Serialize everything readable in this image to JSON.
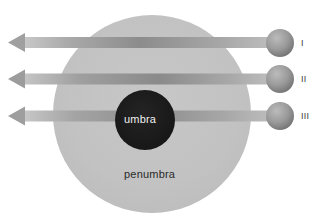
{
  "figure": {
    "type": "eclipse-shadow-diagram",
    "background_color": "#ffffff",
    "width": 322,
    "height": 223
  },
  "shadow_regions": [
    {
      "id": "penumbra",
      "label": "penumbra",
      "color": "#c3c3c3",
      "label_color": "#2a2a2a",
      "center_x": 152,
      "center_y": 114,
      "radius": 99
    },
    {
      "id": "umbra",
      "label": "umbra",
      "color": "#1c1c1c",
      "label_color": "#f0f0f0",
      "center_x": 145,
      "center_y": 120,
      "radius": 30
    }
  ],
  "rays": [
    {
      "id": "ray-1",
      "label": "I",
      "y": 43,
      "arrow_tip_x": 8,
      "tail_x": 282,
      "band_color_light": "#cfcfcf",
      "band_color_dark": "#8e8e8e"
    },
    {
      "id": "ray-2",
      "label": "II",
      "y": 79,
      "arrow_tip_x": 8,
      "tail_x": 282,
      "band_color_light": "#cfcfcf",
      "band_color_dark": "#8e8e8e"
    },
    {
      "id": "ray-3",
      "label": "III",
      "y": 116,
      "arrow_tip_x": 8,
      "tail_x": 282,
      "band_color_light": "#cfcfcf",
      "band_color_dark": "#8e8e8e"
    }
  ],
  "spheres": [
    {
      "id": "sphere-1",
      "label": "I",
      "cx": 280,
      "cy": 43,
      "r": 14,
      "color_light": "#b9b9b9",
      "color_dark": "#747474"
    },
    {
      "id": "sphere-2",
      "label": "II",
      "cx": 280,
      "cy": 79,
      "r": 14,
      "color_light": "#b9b9b9",
      "color_dark": "#747474"
    },
    {
      "id": "sphere-3",
      "label": "III",
      "cx": 280,
      "cy": 116,
      "r": 14,
      "color_light": "#b9b9b9",
      "color_dark": "#747474"
    }
  ],
  "labels": {
    "umbra": "umbra",
    "penumbra": "penumbra",
    "roman_1": "I",
    "roman_2": "II",
    "roman_3": "III"
  }
}
